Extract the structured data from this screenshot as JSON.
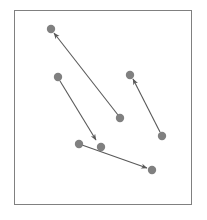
{
  "figure": {
    "title": "",
    "background_color": "#ffffff",
    "width": 207,
    "height": 220
  },
  "frame": {
    "label": "plot-frame",
    "x": 14.5,
    "y": 10.5,
    "width": 177,
    "height": 194,
    "stroke_color": "#808080",
    "stroke_width": 1,
    "fill": "none"
  },
  "chart_data": {
    "type": "scatter",
    "title": "",
    "subtitle": "",
    "xlabel": "",
    "ylabel": "",
    "xlim": [
      14,
      192
    ],
    "ylim": [
      10,
      205
    ],
    "grid": false,
    "legend": null,
    "axis_ticks": [],
    "tick_labels": [],
    "point_color": "#808080",
    "point_radius": 4.2,
    "arrow_color": "#595959",
    "arrow_width": 1.1,
    "points": [
      {
        "id": "p1",
        "x": 51,
        "y": 29
      },
      {
        "id": "p2",
        "x": 58,
        "y": 77
      },
      {
        "id": "p3",
        "x": 130,
        "y": 75
      },
      {
        "id": "p4",
        "x": 120,
        "y": 118
      },
      {
        "id": "p5",
        "x": 162,
        "y": 136
      },
      {
        "id": "p6",
        "x": 79,
        "y": 144
      },
      {
        "id": "p7",
        "x": 101,
        "y": 147
      },
      {
        "id": "p8",
        "x": 152,
        "y": 170
      }
    ],
    "arrows": [
      {
        "id": "a1",
        "from": "p4",
        "to": "p1",
        "x1": 118,
        "y1": 115,
        "x2": 54,
        "y2": 33
      },
      {
        "id": "a2",
        "from": "p2",
        "to": "p7",
        "x1": 60,
        "y1": 81,
        "x2": 96,
        "y2": 140
      },
      {
        "id": "a3",
        "from": "p5",
        "to": "p3",
        "x1": 160,
        "y1": 132,
        "x2": 133,
        "y2": 79
      },
      {
        "id": "a4",
        "from": "p6",
        "to": "p8",
        "x1": 82,
        "y1": 145,
        "x2": 147,
        "y2": 168
      }
    ],
    "annotations": []
  }
}
